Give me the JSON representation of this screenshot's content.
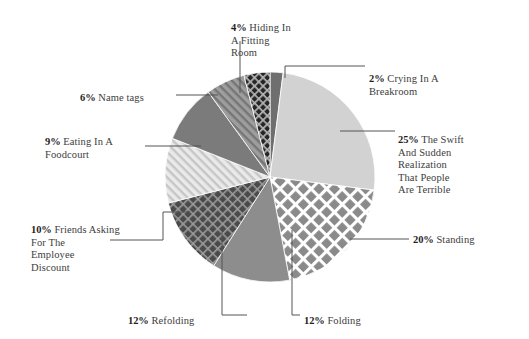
{
  "chart_data": {
    "type": "pie",
    "title": "",
    "subtitle": "",
    "xlabel": "",
    "ylabel": "",
    "legend_position": "callout-labels",
    "grid": false,
    "total": 100,
    "units": "%",
    "start_angle_deg": 0,
    "direction": "clockwise",
    "categories": [
      "Crying In A Breakroom",
      "The Swift And Sudden Realization That People Are Terrible",
      "Standing",
      "Folding",
      "Refolding",
      "Friends Asking For The Employee Discount",
      "Eating In A Foodcourt",
      "Name tags",
      "Hiding In A Fitting Room"
    ],
    "values": [
      2,
      25,
      20,
      12,
      12,
      10,
      9,
      6,
      4
    ],
    "slices": [
      {
        "id": "crying-in-a-breakroom",
        "label": "Crying In A Breakroom",
        "label_lines": [
          "Crying In A",
          "Breakroom"
        ],
        "percent_text": "2%",
        "value": 2,
        "fill": "#6f6f6f",
        "pattern": "solid",
        "label_side": "right"
      },
      {
        "id": "swift-and-sudden-realization",
        "label": "The Swift And Sudden Realization That People Are Terrible",
        "label_lines": [
          "The Swift",
          "And Sudden",
          "Realization",
          "That People",
          "Are Terrible"
        ],
        "percent_text": "25%",
        "value": 25,
        "fill": "#d2d2d2",
        "pattern": "solid",
        "label_side": "right"
      },
      {
        "id": "standing",
        "label": "Standing",
        "label_lines": [
          "Standing"
        ],
        "percent_text": "20%",
        "value": 20,
        "fill": "#8a8a8a",
        "pattern": "lattice",
        "label_side": "right"
      },
      {
        "id": "folding",
        "label": "Folding",
        "label_lines": [
          "Folding"
        ],
        "percent_text": "12%",
        "value": 12,
        "fill": "#8d8d8d",
        "pattern": "solid",
        "label_side": "bottom"
      },
      {
        "id": "refolding",
        "label": "Refolding",
        "label_lines": [
          "Refolding"
        ],
        "percent_text": "12%",
        "value": 12,
        "fill": "#4a4a4a",
        "pattern": "crosshatch",
        "label_side": "bottom"
      },
      {
        "id": "friends-asking-employee-discount",
        "label": "Friends Asking For The Employee Discount",
        "label_lines": [
          "Friends Asking",
          "For The",
          "Employee",
          "Discount"
        ],
        "percent_text": "10%",
        "value": 10,
        "fill": "#dcdcdc",
        "pattern": "diagonal-stripes",
        "label_side": "left"
      },
      {
        "id": "eating-in-a-foodcourt",
        "label": "Eating In A Foodcourt",
        "label_lines": [
          "Eating In A",
          "Foodcourt"
        ],
        "percent_text": "9%",
        "value": 9,
        "fill": "#7b7b7b",
        "pattern": "solid",
        "label_side": "left"
      },
      {
        "id": "name-tags",
        "label": "Name tags",
        "label_lines": [
          "Name tags"
        ],
        "percent_text": "6%",
        "value": 6,
        "fill": "#9a9a9a",
        "pattern": "diagonal-stripes-dark",
        "label_side": "left"
      },
      {
        "id": "hiding-in-a-fitting-room",
        "label": "Hiding In A Fitting Room",
        "label_lines": [
          "Hiding In",
          "A Fitting",
          "Room"
        ],
        "percent_text": "4%",
        "value": 4,
        "fill": "#2f2f2f",
        "pattern": "crosshatch-dark",
        "label_side": "top"
      }
    ]
  },
  "labels": {
    "hiding": {
      "pct": "4%",
      "text": "Hiding In\nA Fitting\nRoom"
    },
    "crying": {
      "pct": "2%",
      "text": "Crying In A\nBreakroom"
    },
    "swift": {
      "pct": "25%",
      "text": "The Swift\nAnd Sudden\nRealization\nThat People\nAre Terrible"
    },
    "standing": {
      "pct": "20%",
      "text": "Standing"
    },
    "folding": {
      "pct": "12%",
      "text": "Folding"
    },
    "refolding": {
      "pct": "12%",
      "text": "Refolding"
    },
    "friends": {
      "pct": "10%",
      "text": "Friends Asking\nFor The\nEmployee\nDiscount"
    },
    "eating": {
      "pct": "9%",
      "text": "Eating In A\nFoodcourt"
    },
    "nametags": {
      "pct": "6%",
      "text": "Name tags"
    }
  },
  "colors": {
    "background": "#ffffff",
    "text": "#3d3d3d",
    "pct_text": "#1f1f1f",
    "leader_line": "#555555"
  }
}
